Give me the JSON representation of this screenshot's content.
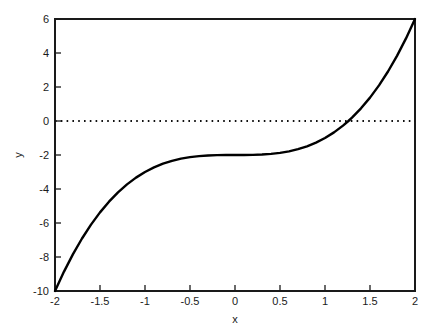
{
  "chart_data": {
    "type": "line",
    "title": "",
    "xlabel": "x",
    "ylabel": "y",
    "xlim": [
      -2,
      2
    ],
    "ylim": [
      -10,
      6
    ],
    "grid": false,
    "legend": null,
    "background_color": "#ffffff",
    "xticks": [
      -2,
      -1.5,
      -1,
      -0.5,
      0,
      0.5,
      1,
      1.5,
      2
    ],
    "xtick_labels": [
      "-2",
      "-1.5",
      "-1",
      "-0.5",
      "0",
      "0.5",
      "1",
      "1.5",
      "2"
    ],
    "yticks": [
      6,
      4,
      2,
      0,
      -2,
      -4,
      -6,
      -8,
      -10
    ],
    "ytick_labels": [
      "6",
      "4",
      "2",
      "0",
      "-2",
      "-4",
      "-6",
      "-8",
      "-10"
    ],
    "series": [
      {
        "name": "cubic-curve",
        "expression": "y = x^3 - 2",
        "style": "solid",
        "color": "#000000",
        "line_width": 2.4,
        "x": [
          -2,
          -1.9,
          -1.8,
          -1.7,
          -1.6,
          -1.5,
          -1.4,
          -1.3,
          -1.2,
          -1.1,
          -1,
          -0.9,
          -0.8,
          -0.7,
          -0.6,
          -0.5,
          -0.4,
          -0.3,
          -0.2,
          -0.1,
          0,
          0.1,
          0.2,
          0.3,
          0.4,
          0.5,
          0.6,
          0.7,
          0.8,
          0.9,
          1,
          1.1,
          1.2,
          1.26,
          1.3,
          1.4,
          1.5,
          1.6,
          1.7,
          1.8,
          1.9,
          2
        ],
        "values": [
          -10,
          -8.859,
          -7.832,
          -6.913,
          -6.096,
          -5.375,
          -4.744,
          -4.197,
          -3.728,
          -3.331,
          -3,
          -2.729,
          -2.512,
          -2.343,
          -2.216,
          -2.125,
          -2.064,
          -2.027,
          -2.008,
          -2.001,
          -2,
          -1.999,
          -1.992,
          -1.973,
          -1.936,
          -1.875,
          -1.784,
          -1.657,
          -1.488,
          -1.271,
          -1,
          -0.669,
          -0.272,
          0,
          0.197,
          0.744,
          1.375,
          2.096,
          2.913,
          3.832,
          4.859,
          6
        ]
      },
      {
        "name": "zero-reference-line",
        "expression": "y = 0",
        "style": "dotted",
        "color": "#000000",
        "line_width": 2,
        "x": [
          -2,
          2
        ],
        "values": [
          0,
          0
        ]
      }
    ],
    "annotations": {
      "root_crossing_x": 1.26
    }
  },
  "axes": {
    "x_title": "x",
    "y_title": "y"
  }
}
